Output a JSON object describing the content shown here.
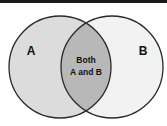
{
  "diagram": {
    "type": "venn",
    "sets": [
      {
        "id": "A",
        "label": "A",
        "fill": "#dcdcdc"
      },
      {
        "id": "B",
        "label": "B",
        "fill": "#f2f2f2"
      }
    ],
    "intersection": {
      "label_line1": "Both",
      "label_line2": "A and B",
      "fill": "#b8b8b8"
    },
    "stroke": "#2a2a2a"
  }
}
